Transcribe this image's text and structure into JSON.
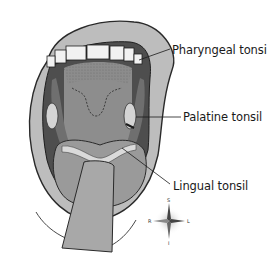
{
  "figure": {
    "labels": [
      {
        "id": "pharyngeal",
        "text": "Pharyngeal tonsil",
        "x": 172,
        "y": 44
      },
      {
        "id": "palatine",
        "text": "Palatine tonsil",
        "x": 183,
        "y": 111
      },
      {
        "id": "lingual",
        "text": "Lingual tonsil",
        "x": 173,
        "y": 180
      }
    ],
    "compass": {
      "superior": "S",
      "inferior": "I",
      "right": "R",
      "left": "L"
    }
  },
  "colors": {
    "lip": "#bdbdbd",
    "lip_outline": "#2a2a2a",
    "mouth_cavity": "#5a5a5a",
    "throat": "#8a8a8a",
    "teeth": "#f2f2f2",
    "tongue": "#9a9a9a",
    "tongue_depressor": "#a8a8a8",
    "tonsil": "#d4d4d4",
    "text": "#1a1a1a",
    "background": "#ffffff"
  }
}
